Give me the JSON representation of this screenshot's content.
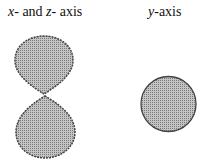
{
  "labels": {
    "left": {
      "var1": "x",
      "mid": "- and ",
      "var2": "z",
      "tail": "- axis"
    },
    "right": {
      "var": "y",
      "tail": "-axis"
    }
  },
  "figures": {
    "left": {
      "description": "two stacked stippled lobes (figure-eight)",
      "fill": "#a8a8a8",
      "stroke": "#444444"
    },
    "right": {
      "description": "single stippled circle",
      "fill": "#a8a8a8",
      "stroke": "#444444"
    }
  }
}
